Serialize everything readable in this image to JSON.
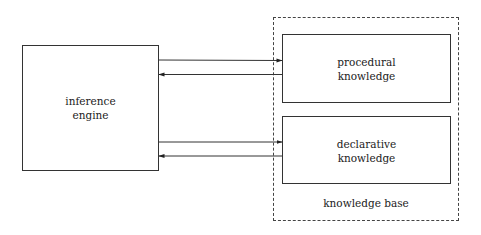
{
  "diagram": {
    "inference_engine": {
      "line1": "inference",
      "line2": "engine"
    },
    "knowledge_base": {
      "label": "knowledge base",
      "procedural": {
        "line1": "procedural",
        "line2": "knowledge"
      },
      "declarative": {
        "line1": "declarative",
        "line2": "knowledge"
      }
    },
    "arrows": [
      {
        "from": "inference engine",
        "to": "procedural knowledge"
      },
      {
        "from": "procedural knowledge",
        "to": "inference engine"
      },
      {
        "from": "inference engine",
        "to": "declarative knowledge"
      },
      {
        "from": "declarative knowledge",
        "to": "inference engine"
      }
    ]
  }
}
